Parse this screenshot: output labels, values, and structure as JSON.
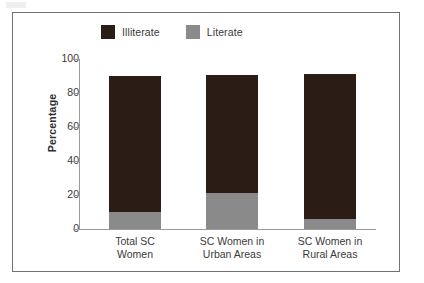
{
  "figure": {
    "legend": [
      {
        "label": "Illiterate",
        "color": "#2b1d16",
        "swatch_name": "legend-swatch-illiterate"
      },
      {
        "label": "Literate",
        "color": "#8a8a8a",
        "swatch_name": "legend-swatch-literate"
      }
    ],
    "axis": {
      "y_title": "Percentage",
      "y_ticks": [
        "0",
        "20",
        "40",
        "60",
        "80",
        "100"
      ]
    }
  },
  "chart_data": {
    "type": "bar",
    "stacked": true,
    "title": "",
    "subtitle": "",
    "xlabel": "",
    "ylabel": "Percentage",
    "ylim": [
      0,
      100
    ],
    "yticks": [
      0,
      20,
      40,
      60,
      80,
      100
    ],
    "grid": false,
    "legend_position": "top",
    "categories": [
      "Total SC\nWomen",
      "SC Women in\nUrban Areas",
      "SC Women in\nRural Areas"
    ],
    "category_lines": [
      [
        "Total SC",
        "Women"
      ],
      [
        "SC Women in",
        "Urban Areas"
      ],
      [
        "SC Women in",
        "Rural Areas"
      ]
    ],
    "series": [
      {
        "name": "Literate",
        "color": "#8a8a8a",
        "values": [
          10,
          21,
          6
        ]
      },
      {
        "name": "Illiterate",
        "color": "#2b1d16",
        "values": [
          80,
          69.5,
          85
        ]
      }
    ],
    "totals": [
      90,
      90.5,
      91
    ]
  }
}
